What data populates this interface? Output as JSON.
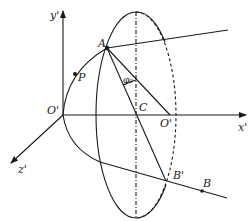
{
  "diagram": {
    "type": "geometry-figure",
    "labels": {
      "y_axis": "y'",
      "x_axis": "x'",
      "z_axis": "z'",
      "origin": "O'",
      "point_A": "A",
      "point_P": "P",
      "point_C": "C",
      "point_O2": "O'",
      "point_B_prime": "B'",
      "point_B": "B",
      "angle": "φ₀"
    }
  }
}
